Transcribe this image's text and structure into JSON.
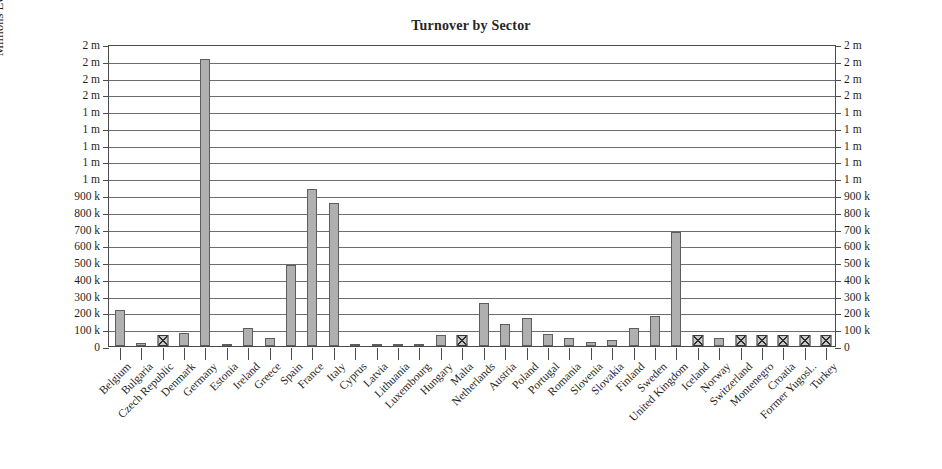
{
  "chart_data": {
    "type": "bar",
    "title": "Turnover by Sector",
    "xlabel": "",
    "ylabel": "Millions EUR Manufacturing",
    "ylim": [
      0,
      1800000
    ],
    "grid": true,
    "legend": "none",
    "ytick_values": [
      0,
      100000,
      200000,
      300000,
      400000,
      500000,
      600000,
      700000,
      800000,
      900000,
      1000000,
      1100000,
      1200000,
      1300000,
      1400000,
      1500000,
      1600000,
      1700000,
      1800000
    ],
    "ytick_labels": [
      "0",
      "100 k",
      "200 k",
      "300 k",
      "400 k",
      "500 k",
      "600 k",
      "700 k",
      "800 k",
      "900 k",
      "1 m",
      "1 m",
      "1 m",
      "1 m",
      "1 m",
      "2 m",
      "2 m",
      "2 m",
      "2 m"
    ],
    "categories": [
      "Belgium",
      "Bulgaria",
      "Czech Republic",
      "Denmark",
      "Germany",
      "Estonia",
      "Ireland",
      "Greece",
      "Spain",
      "France",
      "Italy",
      "Cyprus",
      "Latvia",
      "Lithuania",
      "Luxembourg",
      "Hungary",
      "Malta",
      "Netherlands",
      "Austria",
      "Poland",
      "Portugal",
      "Romania",
      "Slovenia",
      "Slovakia",
      "Finland",
      "Sweden",
      "United Kingdom",
      "Iceland",
      "Norway",
      "Switzerland",
      "Montenegro",
      "Croatia",
      "Former Yugosl..",
      "Turkey"
    ],
    "values": [
      215000,
      18000,
      null,
      75000,
      1710000,
      8000,
      105000,
      45000,
      485000,
      935000,
      855000,
      7000,
      6000,
      11000,
      14000,
      65000,
      null,
      255000,
      130000,
      165000,
      70000,
      45000,
      25000,
      38000,
      110000,
      180000,
      680000,
      null,
      45000,
      null,
      null,
      null,
      null,
      null
    ],
    "missing_marker": "hatched-square",
    "missing_categories": [
      "Czech Republic",
      "Malta",
      "Iceland",
      "Switzerland",
      "Montenegro",
      "Croatia",
      "Former Yugosl..",
      "Turkey"
    ],
    "bar_color": "#b0b0b0",
    "bar_border_color": "#5d5d5d",
    "grid_color": "#6d6d6d",
    "axis_color": "#4a4a4a"
  }
}
